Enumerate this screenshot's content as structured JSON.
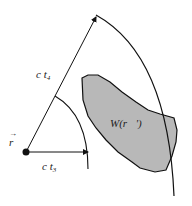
{
  "diagram": {
    "labels": {
      "position_vector": "r",
      "position_vector_arrow": "→",
      "outer_radius": "c t",
      "outer_radius_sub": "4",
      "inner_radius": "c t",
      "inner_radius_sub": "3",
      "region": "W(r⃗')"
    },
    "colors": {
      "stroke": "#111111",
      "region_fill": "#b8b8b8",
      "background": "#ffffff"
    }
  }
}
